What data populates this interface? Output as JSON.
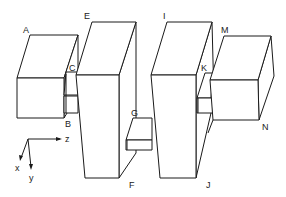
{
  "diagram": {
    "type": "isometric-block-assembly",
    "blocks": [
      {
        "id": "box-left",
        "labels": [
          "A",
          "B"
        ]
      },
      {
        "id": "connector-left",
        "labels": [
          "C"
        ]
      },
      {
        "id": "column-left",
        "labels": [
          "E",
          "F"
        ]
      },
      {
        "id": "connector-middle",
        "labels": [
          "G"
        ]
      },
      {
        "id": "column-right",
        "labels": [
          "I",
          "J"
        ]
      },
      {
        "id": "connector-right",
        "labels": [
          "K"
        ]
      },
      {
        "id": "box-right",
        "labels": [
          "M",
          "N"
        ]
      }
    ],
    "labels": {
      "A": "A",
      "B": "B",
      "C": "C",
      "E": "E",
      "F": "F",
      "G": "G",
      "I": "I",
      "J": "J",
      "K": "K",
      "M": "M",
      "N": "N"
    },
    "axes": {
      "x": "x",
      "y": "y",
      "z": "z"
    },
    "colors": {
      "stroke": "#1a1a1a",
      "fill": "#ffffff",
      "text": "#222222"
    }
  }
}
